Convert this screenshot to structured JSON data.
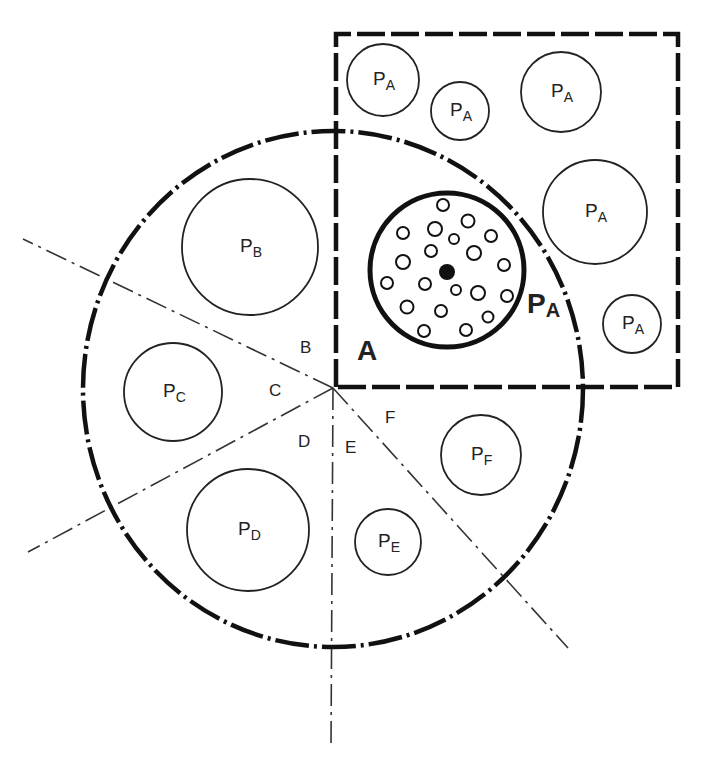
{
  "diagram": {
    "center_label": "A",
    "highlight_label": {
      "main": "P",
      "sub": "A"
    },
    "sector_labels": [
      {
        "id": "B",
        "text": "B",
        "x": 306,
        "y": 347
      },
      {
        "id": "C",
        "text": "C",
        "x": 275,
        "y": 390
      },
      {
        "id": "D",
        "text": "D",
        "x": 304,
        "y": 441
      },
      {
        "id": "E",
        "text": "E",
        "x": 351,
        "y": 447
      },
      {
        "id": "F",
        "text": "F",
        "x": 391,
        "y": 417
      }
    ],
    "particles": [
      {
        "main": "P",
        "sub": "A",
        "region": "square",
        "cx": 383,
        "cy": 80,
        "r": 36
      },
      {
        "main": "P",
        "sub": "A",
        "region": "square",
        "cx": 460,
        "cy": 111,
        "r": 29
      },
      {
        "main": "P",
        "sub": "A",
        "region": "square",
        "cx": 561,
        "cy": 92,
        "r": 40
      },
      {
        "main": "P",
        "sub": "A",
        "region": "square",
        "cx": 595,
        "cy": 212,
        "r": 52
      },
      {
        "main": "P",
        "sub": "A",
        "region": "square",
        "cx": 632,
        "cy": 324,
        "r": 29
      },
      {
        "main": "P",
        "sub": "B",
        "region": "B",
        "cx": 250,
        "cy": 247,
        "r": 68
      },
      {
        "main": "P",
        "sub": "C",
        "region": "C",
        "cx": 173,
        "cy": 392,
        "r": 49
      },
      {
        "main": "P",
        "sub": "D",
        "region": "D",
        "cx": 248,
        "cy": 530,
        "r": 61
      },
      {
        "main": "P",
        "sub": "E",
        "region": "E",
        "cx": 388,
        "cy": 542,
        "r": 33
      },
      {
        "main": "P",
        "sub": "F",
        "region": "F",
        "cx": 481,
        "cy": 455,
        "r": 40
      }
    ],
    "highlight_circle": {
      "cx": 447,
      "cy": 270,
      "r": 77
    },
    "pores": [
      [
        443,
        205,
        6
      ],
      [
        468,
        221,
        6.5
      ],
      [
        403,
        233,
        6
      ],
      [
        435,
        229,
        7
      ],
      [
        454,
        239,
        5
      ],
      [
        491,
        236,
        6
      ],
      [
        431,
        251,
        6
      ],
      [
        474,
        253,
        7
      ],
      [
        403,
        262,
        7
      ],
      [
        504,
        265,
        6
      ],
      [
        387,
        283,
        6
      ],
      [
        425,
        284,
        6
      ],
      [
        456,
        290,
        5
      ],
      [
        478,
        293,
        7
      ],
      [
        507,
        296,
        6
      ],
      [
        407,
        307,
        6.5
      ],
      [
        441,
        311,
        6
      ],
      [
        488,
        317,
        5.5
      ],
      [
        424,
        331,
        6
      ],
      [
        466,
        330,
        6
      ]
    ],
    "nucleus": {
      "cx": 447,
      "cy": 272,
      "r": 8
    }
  }
}
